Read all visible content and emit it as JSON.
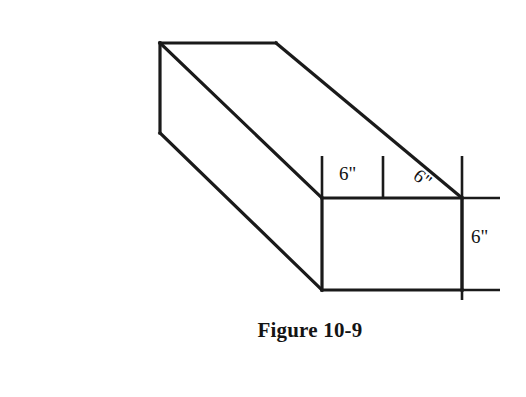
{
  "figure": {
    "caption": "Figure 10-9",
    "caption_x": 310,
    "caption_y": 337,
    "background_color": "#ffffff",
    "line_color": "#1a1a1a",
    "text_color": "#111111"
  },
  "dimensions": {
    "top_left_label": "6\"",
    "top_right_label": "6\"",
    "right_side_label": "6\""
  },
  "geometry": {
    "description": "Isometric rectangular prism (long rectangular bar) drawn in oblique projection with dimension extension lines",
    "box": {
      "top_back_left": "160,43",
      "top_back_right": "276,43",
      "left_back_bottom": "160,133",
      "front_top_left": "322,198",
      "front_bottom_left": "322,290",
      "front_top_right": "462,198",
      "front_bottom_right": "462,290"
    },
    "extension_lines_x": [
      322,
      383,
      462
    ],
    "extension_top_y": 156,
    "horizontal_extension_right_x": 500
  }
}
